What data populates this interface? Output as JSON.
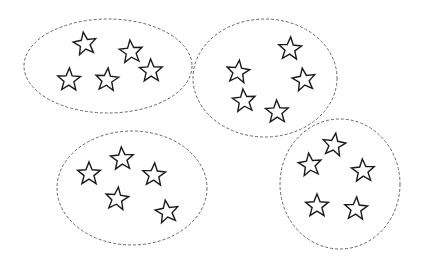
{
  "diagram": {
    "type": "grouping",
    "colors": {
      "outline": "#666666",
      "star_stroke": "#1a1a1a",
      "background": "#ffffff"
    },
    "groups": [
      {
        "name": "group-1",
        "ellipse": {
          "cx": 108,
          "cy": 66,
          "rx": 84,
          "ry": 47
        },
        "stars": [
          {
            "x": 85,
            "y": 44
          },
          {
            "x": 131,
            "y": 52
          },
          {
            "x": 151,
            "y": 71
          },
          {
            "x": 69,
            "y": 80
          },
          {
            "x": 107,
            "y": 80
          }
        ]
      },
      {
        "name": "group-2",
        "ellipse": {
          "cx": 265,
          "cy": 78,
          "rx": 72,
          "ry": 59
        },
        "stars": [
          {
            "x": 290,
            "y": 49
          },
          {
            "x": 238,
            "y": 72
          },
          {
            "x": 304,
            "y": 80
          },
          {
            "x": 244,
            "y": 101
          },
          {
            "x": 277,
            "y": 112
          }
        ]
      },
      {
        "name": "group-3",
        "ellipse": {
          "cx": 132,
          "cy": 188,
          "rx": 75,
          "ry": 57
        },
        "stars": [
          {
            "x": 122,
            "y": 159
          },
          {
            "x": 89,
            "y": 174
          },
          {
            "x": 154,
            "y": 175
          },
          {
            "x": 117,
            "y": 199
          },
          {
            "x": 167,
            "y": 212
          }
        ]
      },
      {
        "name": "group-4",
        "ellipse": {
          "cx": 340,
          "cy": 184,
          "rx": 60,
          "ry": 65
        },
        "stars": [
          {
            "x": 334,
            "y": 145
          },
          {
            "x": 310,
            "y": 165
          },
          {
            "x": 363,
            "y": 171
          },
          {
            "x": 317,
            "y": 206
          },
          {
            "x": 356,
            "y": 209
          }
        ]
      }
    ],
    "stars_per_group": 5,
    "group_count": 4
  }
}
